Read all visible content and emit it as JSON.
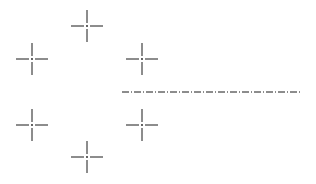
{
  "diagram": {
    "type": "cad-centerline-marks",
    "background": "#ffffff",
    "stroke_color": "#1a1a1a",
    "marks": [
      {
        "id": "top",
        "x": 87,
        "y": 26
      },
      {
        "id": "upper-left",
        "x": 32,
        "y": 59
      },
      {
        "id": "upper-right",
        "x": 142,
        "y": 59
      },
      {
        "id": "lower-left",
        "x": 32,
        "y": 125
      },
      {
        "id": "lower-right",
        "x": 142,
        "y": 125
      },
      {
        "id": "bottom",
        "x": 87,
        "y": 157
      }
    ],
    "centerline": {
      "x1": 122,
      "y1": 92,
      "x2": 300,
      "y2": 92,
      "style": "dash-dot"
    }
  }
}
